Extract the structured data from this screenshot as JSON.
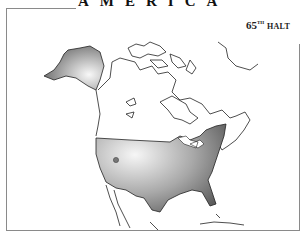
{
  "title": "AMERICA",
  "badge": {
    "number": "65",
    "suffix": "TH",
    "label": "HALT"
  },
  "map": {
    "region": "North America",
    "highlighted": [
      "Alaska",
      "Contiguous United States"
    ],
    "marker": {
      "label": "location-marker",
      "color": "#777777"
    },
    "colors": {
      "outline": "#222222",
      "shade_light": "#f4f4f4",
      "shade_dark": "#555555"
    }
  }
}
